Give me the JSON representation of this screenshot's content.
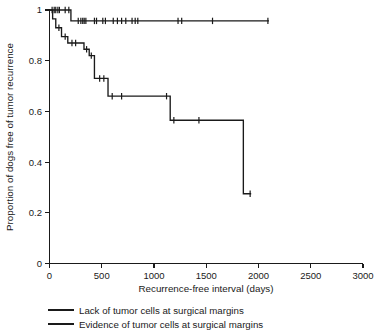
{
  "chart_data": {
    "type": "line",
    "subtype": "kaplan-meier-survival",
    "title": "",
    "xlabel": "Recurrence-free interval (days)",
    "ylabel": "Proportion of dogs free of tumor recurrence",
    "xlim": [
      0,
      3000
    ],
    "ylim": [
      0,
      1
    ],
    "xticks": [
      0,
      500,
      1000,
      1500,
      2000,
      2500,
      3000
    ],
    "xtick_labels": [
      "0",
      "500",
      "1000",
      "1500",
      "2000",
      "2500",
      "3000"
    ],
    "yticks": [
      0,
      0.2,
      0.4,
      0.6,
      0.8,
      1
    ],
    "ytick_labels": [
      "0",
      "0.2",
      "0.4",
      "0.6",
      "0.8",
      "1"
    ],
    "grid": false,
    "legend_position": "below-axes",
    "series": [
      {
        "name": "Lack of tumor cells at surgical margins",
        "color": "#1a1a1a",
        "steps": [
          [
            0,
            1.0
          ],
          [
            205,
            1.0
          ],
          [
            205,
            0.957
          ],
          [
            2100,
            0.957
          ]
        ],
        "censor_points": [
          [
            25,
            1.0
          ],
          [
            45,
            1.0
          ],
          [
            60,
            1.0
          ],
          [
            80,
            1.0
          ],
          [
            95,
            1.0
          ],
          [
            150,
            1.0
          ],
          [
            185,
            1.0
          ],
          [
            275,
            0.957
          ],
          [
            300,
            0.957
          ],
          [
            318,
            0.957
          ],
          [
            332,
            0.957
          ],
          [
            348,
            0.957
          ],
          [
            430,
            0.957
          ],
          [
            450,
            0.957
          ],
          [
            510,
            0.957
          ],
          [
            535,
            0.957
          ],
          [
            610,
            0.957
          ],
          [
            650,
            0.957
          ],
          [
            690,
            0.957
          ],
          [
            730,
            0.957
          ],
          [
            790,
            0.957
          ],
          [
            820,
            0.957
          ],
          [
            845,
            0.957
          ],
          [
            1230,
            0.957
          ],
          [
            1265,
            0.957
          ],
          [
            1560,
            0.957
          ],
          [
            2090,
            0.957
          ]
        ]
      },
      {
        "name": "Evidence of tumor cells at surgical margins",
        "color": "#1a1a1a",
        "steps": [
          [
            0,
            1.0
          ],
          [
            30,
            1.0
          ],
          [
            30,
            0.965
          ],
          [
            60,
            0.965
          ],
          [
            60,
            0.93
          ],
          [
            115,
            0.93
          ],
          [
            115,
            0.895
          ],
          [
            175,
            0.895
          ],
          [
            175,
            0.87
          ],
          [
            330,
            0.87
          ],
          [
            330,
            0.845
          ],
          [
            380,
            0.845
          ],
          [
            380,
            0.82
          ],
          [
            430,
            0.82
          ],
          [
            430,
            0.73
          ],
          [
            560,
            0.73
          ],
          [
            560,
            0.66
          ],
          [
            1155,
            0.66
          ],
          [
            1155,
            0.565
          ],
          [
            1855,
            0.565
          ],
          [
            1855,
            0.275
          ],
          [
            1930,
            0.275
          ]
        ],
        "censor_points": [
          [
            90,
            0.93
          ],
          [
            150,
            0.895
          ],
          [
            215,
            0.87
          ],
          [
            250,
            0.87
          ],
          [
            355,
            0.845
          ],
          [
            400,
            0.82
          ],
          [
            480,
            0.73
          ],
          [
            520,
            0.73
          ],
          [
            600,
            0.66
          ],
          [
            690,
            0.66
          ],
          [
            1120,
            0.66
          ],
          [
            1190,
            0.565
          ],
          [
            1430,
            0.565
          ],
          [
            1920,
            0.275
          ]
        ]
      }
    ]
  },
  "legend": {
    "items": [
      {
        "label": "Lack of tumor cells at surgical margins"
      },
      {
        "label": "Evidence of tumor cells at surgical margins"
      }
    ]
  },
  "axes": {
    "x_title": "Recurrence-free interval (days)",
    "y_title": "Proportion of dogs free of tumor recurrence"
  }
}
